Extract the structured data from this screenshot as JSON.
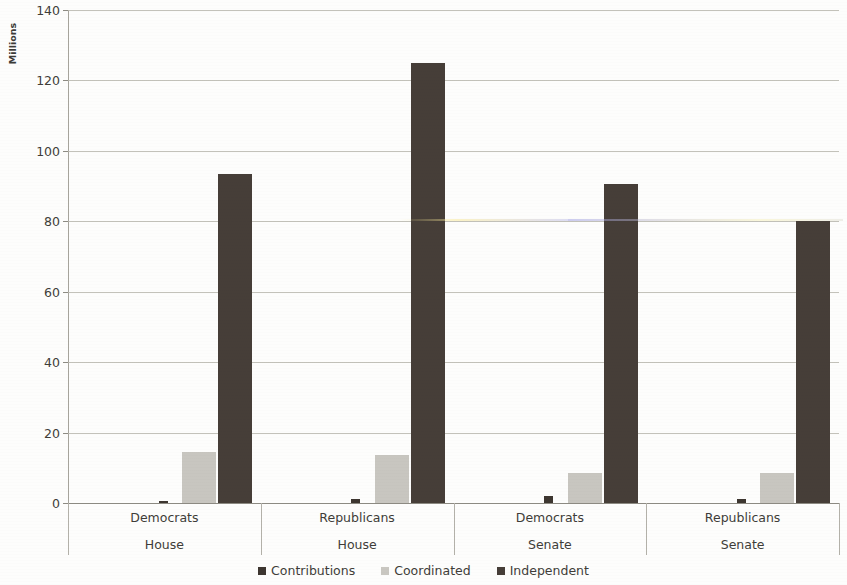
{
  "chart_data": {
    "type": "bar",
    "title": "",
    "subtitle": "",
    "xlabel": "",
    "ylabel": "Millions",
    "ylim": [
      0,
      140
    ],
    "ytick_step": 20,
    "yticks": [
      0,
      20,
      40,
      60,
      80,
      100,
      120,
      140
    ],
    "ytick_labels": [
      "0",
      "20",
      "40",
      "60",
      "80",
      "100",
      "120",
      "140"
    ],
    "grid": true,
    "legend_position": "bottom",
    "categories": [
      "Democrats",
      "Republicans",
      "Democrats",
      "Republicans"
    ],
    "category_sublabels": [
      "House",
      "House",
      "Senate",
      "Senate"
    ],
    "series": [
      {
        "name": "Contributions",
        "color": "#3d3630",
        "values": [
          0.5,
          1.0,
          2.0,
          1.0
        ]
      },
      {
        "name": "Coordinated",
        "color": "#c8c6c0",
        "values": [
          14.5,
          13.5,
          8.5,
          8.5
        ]
      },
      {
        "name": "Independent",
        "color": "#463e38",
        "values": [
          93.5,
          125.0,
          90.5,
          80.0
        ]
      }
    ]
  },
  "legend": {
    "items": [
      {
        "label": "Contributions",
        "swatch": "contributions"
      },
      {
        "label": "Coordinated",
        "swatch": "coordinated"
      },
      {
        "label": "Independent",
        "swatch": "independent"
      }
    ]
  },
  "axis": {
    "y_title": "Millions"
  }
}
